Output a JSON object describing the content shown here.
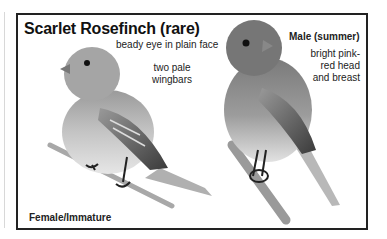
{
  "plate": {
    "title": "Scarlet Rosefinch (rare)",
    "female": {
      "label": "Female/Immature",
      "notes": [
        "beady eye in plain face",
        "two pale",
        "wingbars"
      ]
    },
    "male": {
      "label": "Male (summer)",
      "notes": [
        "bright pink-",
        "red head",
        "and breast"
      ]
    }
  }
}
